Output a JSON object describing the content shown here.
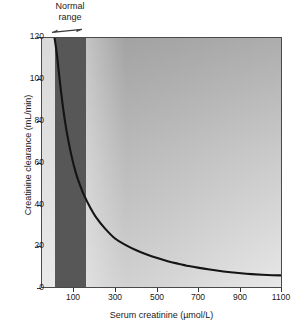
{
  "chart_data": {
    "type": "line",
    "title": "",
    "xlabel": "Serum creatinine (µmol/L)",
    "ylabel": "Creatinine clearance (mL/min)",
    "xlim": [
      0,
      1150
    ],
    "ylim": [
      0,
      120
    ],
    "xticks": [
      100,
      300,
      500,
      700,
      900,
      1100
    ],
    "xtick_labels": [
      "100",
      "300",
      "500",
      "700",
      "900",
      "1100"
    ],
    "yticks": [
      0,
      20,
      40,
      60,
      80,
      100,
      120
    ],
    "ytick_labels": [
      "0",
      "20",
      "40",
      "60",
      "80",
      "100",
      "120"
    ],
    "grid": false,
    "legend": null,
    "series": [
      {
        "name": "Creatinine clearance vs serum creatinine",
        "x": [
          60,
          70,
          80,
          90,
          100,
          110,
          120,
          140,
          160,
          180,
          200,
          230,
          260,
          300,
          350,
          400,
          450,
          500,
          550,
          600,
          650,
          700,
          750,
          800,
          850,
          900,
          950,
          1000,
          1050,
          1100,
          1150
        ],
        "y": [
          120,
          113,
          104,
          95,
          87,
          80,
          74,
          64,
          56,
          50,
          45,
          39,
          34,
          29,
          24,
          21,
          18.5,
          16.5,
          14.8,
          13.3,
          12.1,
          11.0,
          10.1,
          9.3,
          8.6,
          8.0,
          7.5,
          7.1,
          6.8,
          6.6,
          6.5
        ]
      }
    ],
    "annotations": [
      {
        "name": "normal-range",
        "label_line1": "Normal",
        "label_line2": "range",
        "arrow": "double-headed",
        "x_start": 60,
        "x_end": 210,
        "shaded_band": true,
        "band_color": "#575757"
      }
    ],
    "colors": {
      "curve": "#141414",
      "axis": "#333333",
      "frame": "#4a4a4a",
      "band": "#575757",
      "background_left": "#d0d0d0",
      "background_right": "#ededed",
      "text": "#1a1a1a"
    }
  },
  "axes": {
    "x_title": "Serum creatinine (µmol/L)",
    "y_title": "Creatinine clearance (mL/min)"
  },
  "annotation": {
    "normal_range_line1": "Normal",
    "normal_range_line2": "range"
  },
  "caption": {
    "text": ""
  }
}
